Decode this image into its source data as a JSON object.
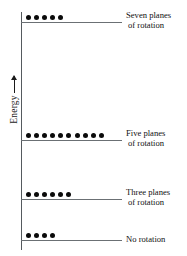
{
  "figure": {
    "axis": {
      "label": "Energy",
      "arrow_icon": "up-arrow-icon",
      "direction": "increasing upward"
    }
  },
  "chart_data": {
    "type": "bar",
    "title": "",
    "subtitle": "",
    "xlabel": "",
    "ylabel": "Energy",
    "grid": false,
    "legend": null,
    "axis_ranges": {
      "y": "qualitative, increasing upward"
    },
    "categories": [
      "No rotation",
      "Three planes of rotation",
      "Five planes of rotation",
      "Seven planes of rotation"
    ],
    "values": [
      4,
      6,
      10,
      5
    ],
    "series": [
      {
        "name": "Electron count",
        "values": [
          4,
          6,
          10,
          5
        ]
      }
    ],
    "levels": [
      {
        "id": "level-seven-planes",
        "label_line1": "Seven planes",
        "label_line2": "of rotation",
        "label_full": "Seven planes of rotation",
        "electron_count": 5,
        "energy_rank": 4,
        "line_top_px": 22,
        "line_width_px": 101
      },
      {
        "id": "level-five-planes",
        "label_line1": "Five planes",
        "label_line2": "of rotation",
        "label_full": "Five planes of rotation",
        "electron_count": 10,
        "energy_rank": 3,
        "line_top_px": 140,
        "line_width_px": 101
      },
      {
        "id": "level-three-planes",
        "label_line1": "Three planes",
        "label_line2": "of rotation",
        "label_full": "Three planes of rotation",
        "electron_count": 6,
        "energy_rank": 2,
        "line_top_px": 199,
        "line_width_px": 101
      },
      {
        "id": "level-no-rotation",
        "label_line1": "No rotation",
        "label_line2": "",
        "label_full": "No rotation",
        "electron_count": 4,
        "energy_rank": 1,
        "line_top_px": 240,
        "line_width_px": 101
      }
    ],
    "colors": {
      "electron": "#0b0b0b",
      "level_line": "#6b7074",
      "axis": "#555a5e",
      "text": "#111111",
      "background": "#ffffff"
    }
  }
}
